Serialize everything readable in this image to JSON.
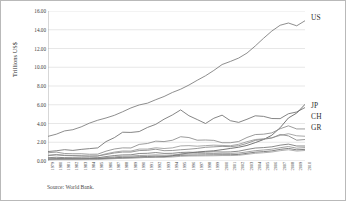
{
  "figure": {
    "ylabel": "Trillions US$",
    "source_note": "Source: World Bank.",
    "background_color": "#ffffff",
    "border_color": "#b9b9b9",
    "gridline_color": "#d6d6d6"
  },
  "series_labels": [
    {
      "key": "US",
      "text": "US",
      "x": 311,
      "y": 13
    },
    {
      "key": "JP",
      "text": "JP",
      "x": 311,
      "y": 101
    },
    {
      "key": "CH",
      "text": "CH",
      "x": 311,
      "y": 112
    },
    {
      "key": "GR",
      "text": "GR",
      "x": 311,
      "y": 123
    }
  ],
  "chart_data": {
    "type": "line",
    "title": "",
    "subtitle": "",
    "xlabel": "",
    "ylabel": "Trillions US$",
    "ylim": [
      0,
      16
    ],
    "ytick_values": [
      0,
      2,
      4,
      6,
      8,
      10,
      12,
      14,
      16
    ],
    "ytick_labels": [
      "0.00",
      "2.00",
      "4.00",
      "6.00",
      "8.00",
      "10.00",
      "12.00",
      "14.00",
      "16.00"
    ],
    "grid": true,
    "grid_axis": "y",
    "legend_position": "right-inline-labels",
    "annotation": "Source: World Bank.",
    "x": [
      1979,
      1980,
      1981,
      1982,
      1983,
      1984,
      1985,
      1986,
      1987,
      1988,
      1989,
      1990,
      1991,
      1992,
      1993,
      1994,
      1995,
      1996,
      1997,
      1998,
      1999,
      2000,
      2001,
      2002,
      2003,
      2004,
      2005,
      2006,
      2007,
      2008,
      2009,
      2010
    ],
    "xtick_labels": [
      "1979",
      "1980",
      "1981",
      "1982",
      "1983",
      "1984",
      "1985",
      "1986",
      "1987",
      "1988",
      "1989",
      "1990",
      "1991",
      "1992",
      "1993",
      "1994",
      "1995",
      "1996",
      "1997",
      "1998",
      "1999",
      "2000",
      "2001",
      "2002",
      "2003",
      "2004",
      "2005",
      "2006",
      "2007",
      "2008",
      "2009",
      "2010"
    ],
    "series": [
      {
        "name": "US",
        "label": "US",
        "color": "#7a7a7a",
        "values": [
          2.63,
          2.86,
          3.21,
          3.34,
          3.64,
          4.04,
          4.35,
          4.59,
          4.87,
          5.25,
          5.66,
          5.98,
          6.17,
          6.54,
          6.88,
          7.31,
          7.66,
          8.1,
          8.61,
          9.09,
          9.66,
          10.29,
          10.62,
          10.98,
          11.51,
          12.27,
          13.09,
          13.86,
          14.48,
          14.72,
          14.42,
          14.96
        ]
      },
      {
        "name": "JP",
        "label": "JP",
        "color": "#6f6f6f",
        "values": [
          1.01,
          1.09,
          1.21,
          1.13,
          1.24,
          1.32,
          1.4,
          2.07,
          2.49,
          3.07,
          3.05,
          3.14,
          3.58,
          3.91,
          4.46,
          4.91,
          5.45,
          4.83,
          4.42,
          4.0,
          4.56,
          4.89,
          4.3,
          4.12,
          4.45,
          4.82,
          4.76,
          4.53,
          4.52,
          5.04,
          5.23,
          5.7
        ]
      },
      {
        "name": "CH",
        "label": "CH",
        "color": "#5d5d5d",
        "values": [
          0.18,
          0.19,
          0.2,
          0.21,
          0.23,
          0.26,
          0.31,
          0.3,
          0.27,
          0.31,
          0.35,
          0.36,
          0.38,
          0.42,
          0.44,
          0.56,
          0.73,
          0.86,
          0.96,
          1.03,
          1.09,
          1.21,
          1.34,
          1.47,
          1.66,
          1.96,
          2.29,
          2.75,
          3.55,
          4.59,
          5.11,
          6.04
        ]
      },
      {
        "name": "GR",
        "label": "GR",
        "color": "#8a8a8a",
        "values": [
          0.88,
          0.95,
          0.8,
          0.77,
          0.77,
          0.72,
          0.73,
          1.05,
          1.28,
          1.4,
          1.39,
          1.77,
          1.87,
          2.12,
          2.07,
          2.21,
          2.59,
          2.5,
          2.22,
          2.24,
          2.2,
          1.95,
          1.95,
          2.08,
          2.51,
          2.82,
          2.86,
          3.0,
          3.44,
          3.75,
          3.42,
          3.42
        ]
      },
      {
        "name": "series-5",
        "label": "",
        "color": "#9a9a9a",
        "values": [
          0.62,
          0.7,
          0.62,
          0.58,
          0.56,
          0.53,
          0.54,
          0.77,
          0.95,
          1.07,
          1.06,
          1.27,
          1.27,
          1.41,
          1.33,
          1.4,
          1.61,
          1.64,
          1.58,
          1.64,
          1.69,
          1.66,
          1.63,
          1.78,
          2.06,
          2.29,
          2.37,
          2.48,
          2.73,
          2.91,
          2.69,
          2.64
        ]
      },
      {
        "name": "series-6",
        "label": "",
        "color": "#868686",
        "values": [
          0.57,
          0.65,
          0.58,
          0.56,
          0.53,
          0.51,
          0.53,
          0.69,
          0.85,
          0.95,
          0.95,
          1.11,
          1.14,
          1.26,
          1.1,
          1.12,
          1.2,
          1.26,
          1.34,
          1.46,
          1.51,
          1.56,
          1.53,
          1.63,
          1.88,
          2.2,
          2.32,
          2.45,
          2.83,
          2.68,
          2.22,
          2.29
        ]
      },
      {
        "name": "series-7",
        "label": "",
        "color": "#757575",
        "values": [
          0.35,
          0.4,
          0.36,
          0.35,
          0.34,
          0.33,
          0.34,
          0.47,
          0.58,
          0.65,
          0.66,
          0.8,
          0.82,
          0.9,
          0.81,
          0.82,
          0.91,
          0.94,
          0.91,
          0.95,
          0.98,
          0.96,
          0.97,
          1.05,
          1.23,
          1.38,
          1.43,
          1.51,
          1.69,
          1.8,
          1.6,
          1.6
        ]
      },
      {
        "name": "series-8",
        "label": "",
        "color": "#919191",
        "values": [
          0.23,
          0.26,
          0.27,
          0.27,
          0.26,
          0.27,
          0.28,
          0.36,
          0.44,
          0.51,
          0.52,
          0.59,
          0.61,
          0.65,
          0.61,
          0.64,
          0.73,
          0.76,
          0.77,
          0.79,
          0.8,
          0.82,
          0.81,
          0.85,
          0.97,
          1.1,
          1.17,
          1.26,
          1.42,
          1.54,
          1.37,
          1.43
        ]
      },
      {
        "name": "series-9",
        "label": "",
        "color": "#6a6a6a",
        "values": [
          0.19,
          0.22,
          0.22,
          0.21,
          0.2,
          0.21,
          0.22,
          0.28,
          0.34,
          0.39,
          0.4,
          0.46,
          0.48,
          0.52,
          0.49,
          0.52,
          0.6,
          0.62,
          0.63,
          0.65,
          0.66,
          0.67,
          0.67,
          0.7,
          0.82,
          0.94,
          1.0,
          1.08,
          1.24,
          1.34,
          1.19,
          1.24
        ]
      },
      {
        "name": "series-10",
        "label": "",
        "color": "#a0a0a0",
        "values": [
          0.12,
          0.14,
          0.14,
          0.14,
          0.14,
          0.15,
          0.16,
          0.2,
          0.25,
          0.29,
          0.31,
          0.36,
          0.38,
          0.41,
          0.4,
          0.43,
          0.5,
          0.53,
          0.54,
          0.55,
          0.56,
          0.58,
          0.58,
          0.61,
          0.71,
          0.82,
          0.88,
          0.96,
          1.1,
          1.2,
          1.06,
          1.12
        ]
      }
    ]
  }
}
